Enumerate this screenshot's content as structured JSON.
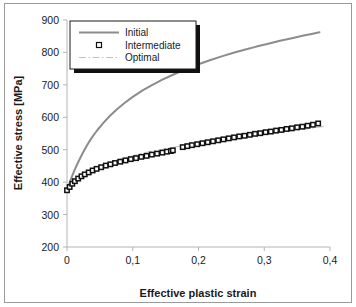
{
  "chart_data": {
    "type": "line",
    "title": "",
    "xlabel": "Effective plastic strain",
    "ylabel": "Effective stress [MPa]",
    "xlim": [
      0,
      0.4
    ],
    "ylim": [
      200,
      900
    ],
    "xticks": [
      "0",
      "0,1",
      "0,2",
      "0,3",
      "0,4"
    ],
    "xtick_values": [
      0,
      0.1,
      0.2,
      0.3,
      0.4
    ],
    "yticks": [
      "200",
      "300",
      "400",
      "500",
      "600",
      "700",
      "800",
      "900"
    ],
    "ytick_values": [
      200,
      300,
      400,
      500,
      600,
      700,
      800,
      900
    ],
    "grid": false,
    "legend_position": "upper-left",
    "series": [
      {
        "name": "Initial",
        "style": "solid-line",
        "color": "#8c8c8c",
        "x": [
          0,
          0.004,
          0.008,
          0.013,
          0.018,
          0.024,
          0.03,
          0.038,
          0.046,
          0.055,
          0.065,
          0.076,
          0.088,
          0.1,
          0.115,
          0.13,
          0.145,
          0.162,
          0.18,
          0.198,
          0.216,
          0.234,
          0.252,
          0.27,
          0.288,
          0.306,
          0.324,
          0.342,
          0.36,
          0.372,
          0.384
        ],
        "y": [
          375,
          398,
          420,
          444,
          466,
          490,
          512,
          538,
          560,
          582,
          604,
          625,
          645,
          663,
          683,
          700,
          716,
          732,
          748,
          762,
          775,
          787,
          798,
          808,
          818,
          827,
          836,
          844,
          852,
          857,
          862
        ]
      },
      {
        "name": "Intermediate",
        "style": "square-markers",
        "color": "#111111",
        "x": [
          0,
          0.004,
          0.008,
          0.012,
          0.017,
          0.022,
          0.027,
          0.033,
          0.039,
          0.045,
          0.052,
          0.059,
          0.066,
          0.073,
          0.081,
          0.089,
          0.097,
          0.105,
          0.113,
          0.121,
          0.129,
          0.137,
          0.145,
          0.152,
          0.158,
          0.161,
          0.176,
          0.183,
          0.19,
          0.198,
          0.206,
          0.214,
          0.222,
          0.23,
          0.238,
          0.246,
          0.254,
          0.262,
          0.27,
          0.278,
          0.286,
          0.294,
          0.302,
          0.31,
          0.318,
          0.326,
          0.334,
          0.342,
          0.35,
          0.358,
          0.366,
          0.374,
          0.382
        ],
        "y": [
          375,
          385,
          395,
          403,
          411,
          418,
          424,
          430,
          436,
          441,
          446,
          451,
          455,
          459,
          463,
          467,
          471,
          474,
          478,
          481,
          485,
          488,
          491,
          494,
          496,
          498,
          508,
          511,
          514,
          517,
          520,
          523,
          526,
          529,
          532,
          535,
          538,
          541,
          543,
          546,
          549,
          551,
          554,
          556,
          559,
          561,
          564,
          566,
          569,
          571,
          574,
          577,
          581
        ],
        "note": "data gap between x=0.161 and x=0.176 with step up in stress"
      },
      {
        "name": "Optimal",
        "style": "dash-dot-line",
        "color": "#c8c8c8",
        "x": [
          0,
          0.005,
          0.011,
          0.018,
          0.025,
          0.033,
          0.042,
          0.051,
          0.061,
          0.072,
          0.084,
          0.096,
          0.11,
          0.125,
          0.14,
          0.156,
          0.173,
          0.19,
          0.208,
          0.226,
          0.245,
          0.264,
          0.283,
          0.302,
          0.321,
          0.34,
          0.36,
          0.38,
          0.395
        ],
        "y": [
          377,
          390,
          402,
          414,
          424,
          434,
          443,
          451,
          459,
          466,
          473,
          479,
          486,
          493,
          499,
          505,
          511,
          517,
          522,
          528,
          533,
          538,
          543,
          548,
          553,
          558,
          563,
          569,
          573
        ]
      }
    ]
  },
  "legend": {
    "items": [
      {
        "label": "Initial",
        "marker": "solid-line-swatch"
      },
      {
        "label": "Intermediate",
        "marker": "square-marker-swatch"
      },
      {
        "label": "Optimal",
        "marker": "dash-dot-line-swatch"
      }
    ]
  },
  "axes": {
    "x_title": "Effective plastic strain",
    "y_title": "Effective stress [MPa]",
    "x_tick_labels": [
      "0",
      "0,1",
      "0,2",
      "0,3",
      "0,4"
    ],
    "y_tick_labels": [
      "900",
      "800",
      "700",
      "600",
      "500",
      "400",
      "300",
      "200"
    ]
  },
  "colors": {
    "initial": "#8c8c8c",
    "intermediate": "#111111",
    "optimal": "#c8c8c8",
    "axis": "#b4b4b4",
    "frame": "#9a9a9a",
    "text": "#1a1a1a"
  }
}
